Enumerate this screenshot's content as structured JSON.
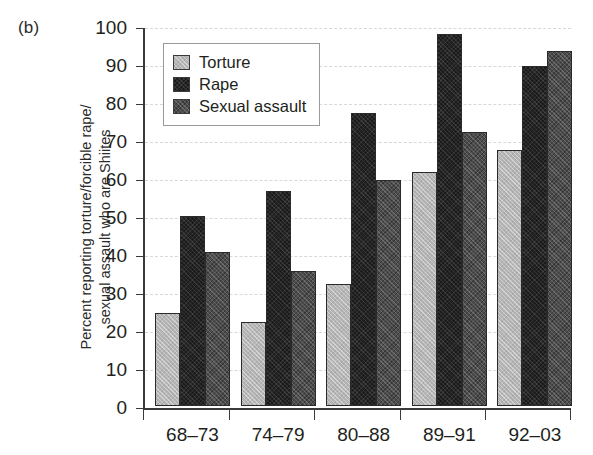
{
  "panel_label": "(b)",
  "legend": {
    "position": "top-left-inside",
    "entries": [
      {
        "label": "Torture",
        "swatch_name": "legend-swatch-torture",
        "color": "#b5b5b5"
      },
      {
        "label": "Rape",
        "swatch_name": "legend-swatch-rape",
        "color": "#1b1b1b"
      },
      {
        "label": "Sexual assault",
        "swatch_name": "legend-swatch-sexual-assault",
        "color": "#4c4c4c"
      }
    ]
  },
  "axes": {
    "y_title": "Percent reporting torture/forcible rape/\nsexual assault who are Shiites",
    "y_ticks": [
      "0",
      "10",
      "20",
      "30",
      "40",
      "50",
      "60",
      "70",
      "80",
      "90",
      "100"
    ],
    "x_ticks": [
      "68–73",
      "74–79",
      "80–88",
      "89–91",
      "92–03"
    ]
  },
  "chart_data": {
    "type": "bar",
    "title": "(b)",
    "xlabel": "",
    "ylabel": "Percent reporting torture/forcible rape/ sexual assault who are Shiites",
    "categories": [
      "68–73",
      "74–79",
      "80–88",
      "89–91",
      "92–03"
    ],
    "series": [
      {
        "name": "Torture",
        "color": "#b5b5b5",
        "values": [
          24.5,
          22,
          32,
          61.5,
          67.5
        ]
      },
      {
        "name": "Rape",
        "color": "#1b1b1b",
        "values": [
          50,
          56.5,
          77,
          98,
          89.5
        ]
      },
      {
        "name": "Sexual assault",
        "color": "#4c4c4c",
        "values": [
          40.5,
          35.5,
          59.5,
          72,
          93.5
        ]
      }
    ],
    "ylim": [
      0,
      100
    ],
    "ytick_step": 10,
    "grid": true,
    "legend_position": "upper left"
  }
}
